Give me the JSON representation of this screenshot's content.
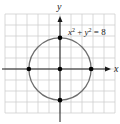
{
  "chart_data": {
    "type": "scatter",
    "title": "",
    "xlabel": "x",
    "ylabel": "y",
    "xlim": [
      -5,
      5
    ],
    "ylim": [
      -5,
      4
    ],
    "grid": true,
    "curve": {
      "kind": "circle",
      "equation": "x² + y² = 8",
      "center": [
        0,
        0
      ],
      "radius_squared": 8
    },
    "points": [
      {
        "x": 0,
        "y": 0
      },
      {
        "x": 2.83,
        "y": 0
      },
      {
        "x": -2.83,
        "y": 0
      },
      {
        "x": 0,
        "y": 2.83
      },
      {
        "x": 0,
        "y": -2.83
      }
    ],
    "annotation": {
      "text_base_x": "x",
      "text_sup_x": "2",
      "text_plus": " + ",
      "text_base_y": "y",
      "text_sup_y": "2",
      "text_eq": " = 8"
    },
    "colors": {
      "grid": "#cfcfcf",
      "axes": "#1a1a1a",
      "curve": "#6e6e6e",
      "points": "#000000"
    }
  }
}
